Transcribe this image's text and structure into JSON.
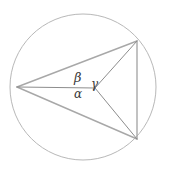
{
  "figure": {
    "type": "geometry-diagram",
    "canvas": {
      "width": 169,
      "height": 174,
      "background": "#ffffff"
    },
    "colors": {
      "circle_stroke": "#b8b8b8",
      "triangle_stroke": "#a8a8a8",
      "cevian_stroke": "#8d8d8d",
      "label_text": "#3a3a3a"
    },
    "circle": {
      "cx": 83,
      "cy": 87,
      "r": 73,
      "stroke_width": 1
    },
    "points": {
      "A": {
        "x": 17,
        "y": 87,
        "role": "left-vertex"
      },
      "B": {
        "x": 137,
        "y": 41,
        "role": "top-right-vertex"
      },
      "C": {
        "x": 137,
        "y": 139,
        "role": "bottom-right-vertex"
      },
      "P": {
        "x": 95,
        "y": 88,
        "role": "interior-point"
      }
    },
    "segments": [
      {
        "name": "side-AB",
        "from": "A",
        "to": "B"
      },
      {
        "name": "side-BC",
        "from": "B",
        "to": "C"
      },
      {
        "name": "side-CA",
        "from": "C",
        "to": "A"
      },
      {
        "name": "cevian-AP",
        "from": "A",
        "to": "P"
      },
      {
        "name": "cevian-PB",
        "from": "P",
        "to": "B"
      },
      {
        "name": "cevian-PC",
        "from": "P",
        "to": "C"
      }
    ],
    "labels": {
      "beta": "β",
      "alpha": "α",
      "gamma": "γ"
    }
  }
}
